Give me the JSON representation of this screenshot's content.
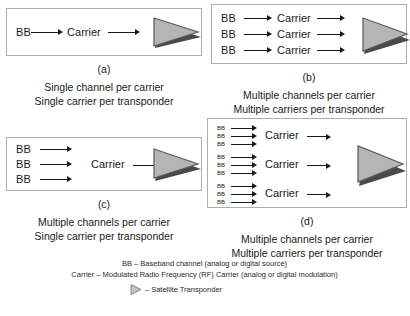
{
  "figure": {
    "labels": {
      "bb": "BB",
      "carrier": "Carrier"
    },
    "panels": [
      {
        "letter": "(a)",
        "caption_line1": "Single channel per carrier",
        "caption_line2": "Single carrier per transponder",
        "channels": 1,
        "carriers": 1,
        "channels_per_carrier": 1
      },
      {
        "letter": "(b)",
        "caption_line1": "Multiple channels per carrier",
        "caption_line2": "Multiple carriers per transponder",
        "channels": 3,
        "carriers": 3,
        "channels_per_carrier": 1
      },
      {
        "letter": "(c)",
        "caption_line1": "Multiple channels per carrier",
        "caption_line2": "Single carrier per transponder",
        "channels": 3,
        "carriers": 1,
        "channels_per_carrier": 3
      },
      {
        "letter": "(d)",
        "caption_line1": "Multiple channels per carrier",
        "caption_line2": "Multiple carriers per transponder",
        "channels": 9,
        "carriers": 3,
        "channels_per_carrier": 3
      }
    ]
  },
  "legend": {
    "bb_definition": "BB – Baseband channel (analog or digital source)",
    "carrier_definition": "Carrier – Modulated Radio Frequency (RF) Carrier (analog or digital modulation)",
    "transponder_definition": "– Satellite Transponder",
    "transponder_icon": "triangle-transponder-icon"
  },
  "colors": {
    "triangle_fill": "#b5b5b5",
    "triangle_shadow": "#4a4a4a",
    "triangle_stroke": "#5a5a5a",
    "panel_border": "#adadad",
    "text": "#1a1a1a",
    "background": "#ffffff"
  }
}
